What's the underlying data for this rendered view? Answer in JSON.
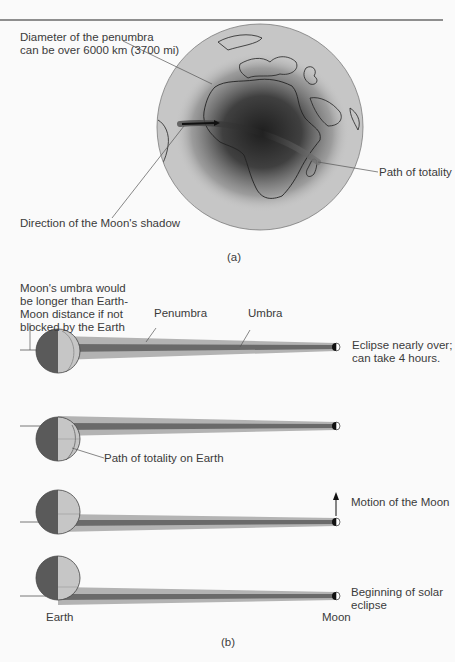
{
  "panel_a": {
    "label_penumbra_line1": "Diameter of the penumbra",
    "label_penumbra_line2": "can be over 6000 km (3700 mi)",
    "label_direction": "Direction of the Moon's shadow",
    "label_path": "Path of totality",
    "caption": "(a)"
  },
  "panel_b": {
    "umbra_note_lines": [
      "Moon's umbra would",
      "be longer than Earth-",
      "Moon distance if not",
      "blocked by the Earth"
    ],
    "label_penumbra": "Penumbra",
    "label_umbra": "Umbra",
    "stage1_lines": [
      "Eclipse nearly over;",
      "can take 4 hours."
    ],
    "label_path_earth": "Path of totality on Earth",
    "label_motion": "Motion of the Moon",
    "stage4_lines": [
      "Beginning of solar",
      "eclipse"
    ],
    "label_earth": "Earth",
    "label_moon": "Moon",
    "caption": "(b)"
  },
  "colors": {
    "earth_night": "#5e5e5e",
    "earth_day": "#c4c4c4",
    "penumbra": "#b3b3b3",
    "umbra": "#6a6a6a",
    "globe": "#c8c8c8"
  }
}
